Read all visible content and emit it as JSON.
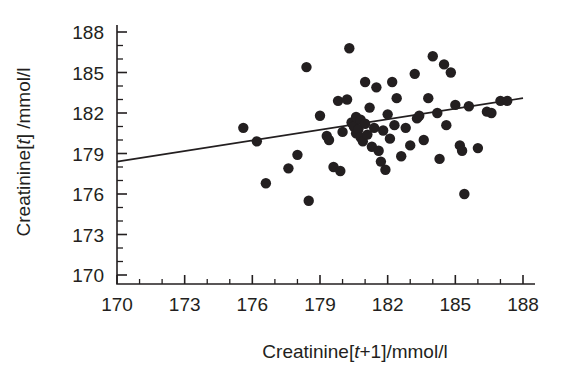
{
  "chart_data": {
    "type": "scatter",
    "title": "",
    "xlabel": "Creatinine[t+1]/mmol/l",
    "ylabel": "Creatinine[t] /mmol/l",
    "xlabel_parts": {
      "pre": "Creatinine[",
      "ital": "t",
      "post": "+1]/mmol/l"
    },
    "ylabel_parts": {
      "pre": "Creatinine[",
      "ital": "t",
      "post": "] /mmol/l"
    },
    "xlim": [
      170,
      188
    ],
    "ylim": [
      170,
      188
    ],
    "xticks": [
      170,
      173,
      176,
      179,
      182,
      185,
      188
    ],
    "yticks": [
      170,
      173,
      176,
      179,
      182,
      185,
      188
    ],
    "xtick_labels": [
      "170",
      "173",
      "176",
      "179",
      "182",
      "185",
      "188"
    ],
    "ytick_labels": [
      "170",
      "173",
      "176",
      "179",
      "182",
      "185",
      "188"
    ],
    "minor_tick_interval": 1,
    "grid": false,
    "legend": null,
    "marker": "filled-circle",
    "marker_color": "#231f20",
    "marker_size_px": 5.2,
    "line_color": "#231f20",
    "fit_line": {
      "type": "linear-regression",
      "x_start": 170,
      "y_start": 178.4,
      "x_end": 188,
      "y_end": 183.1,
      "slope": 0.261,
      "intercept": 134.0
    },
    "points": [
      [
        175.6,
        180.9
      ],
      [
        176.2,
        179.9
      ],
      [
        176.6,
        176.8
      ],
      [
        177.6,
        177.9
      ],
      [
        178.0,
        178.9
      ],
      [
        178.4,
        185.4
      ],
      [
        178.5,
        175.5
      ],
      [
        179.0,
        181.8
      ],
      [
        179.3,
        180.3
      ],
      [
        179.4,
        180.0
      ],
      [
        179.6,
        178.0
      ],
      [
        179.8,
        182.9
      ],
      [
        179.9,
        177.7
      ],
      [
        180.0,
        180.6
      ],
      [
        180.2,
        183.0
      ],
      [
        180.3,
        186.8
      ],
      [
        180.4,
        181.3
      ],
      [
        180.5,
        181.0
      ],
      [
        180.6,
        180.5
      ],
      [
        180.6,
        181.7
      ],
      [
        180.7,
        180.8
      ],
      [
        180.8,
        181.5
      ],
      [
        180.8,
        180.2
      ],
      [
        180.9,
        179.9
      ],
      [
        181.0,
        181.2
      ],
      [
        181.0,
        184.3
      ],
      [
        181.1,
        180.4
      ],
      [
        181.2,
        182.4
      ],
      [
        181.3,
        179.5
      ],
      [
        181.4,
        180.9
      ],
      [
        181.5,
        183.9
      ],
      [
        181.6,
        179.2
      ],
      [
        181.7,
        178.4
      ],
      [
        181.8,
        180.7
      ],
      [
        181.9,
        177.8
      ],
      [
        182.0,
        181.9
      ],
      [
        182.1,
        180.1
      ],
      [
        182.2,
        184.3
      ],
      [
        182.3,
        181.1
      ],
      [
        182.4,
        183.1
      ],
      [
        182.6,
        178.8
      ],
      [
        182.8,
        180.9
      ],
      [
        183.0,
        179.6
      ],
      [
        183.2,
        184.9
      ],
      [
        183.3,
        181.6
      ],
      [
        183.4,
        181.8
      ],
      [
        183.6,
        180.0
      ],
      [
        183.8,
        183.1
      ],
      [
        184.0,
        186.2
      ],
      [
        184.2,
        182.0
      ],
      [
        184.3,
        178.6
      ],
      [
        184.5,
        185.6
      ],
      [
        184.6,
        181.1
      ],
      [
        184.8,
        185.0
      ],
      [
        185.0,
        182.6
      ],
      [
        185.2,
        179.6
      ],
      [
        185.3,
        179.2
      ],
      [
        185.4,
        176.0
      ],
      [
        185.6,
        182.5
      ],
      [
        186.0,
        179.4
      ],
      [
        186.4,
        182.1
      ],
      [
        186.6,
        182.0
      ],
      [
        187.0,
        182.9
      ],
      [
        187.3,
        182.9
      ]
    ]
  }
}
